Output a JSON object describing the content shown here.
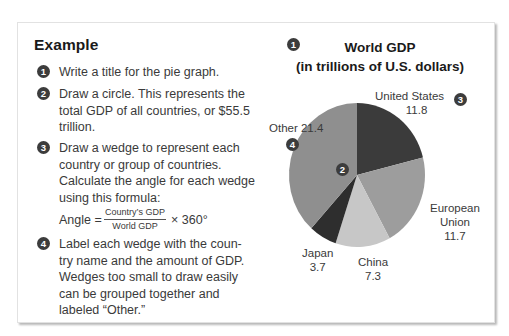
{
  "example": {
    "heading": "Example",
    "steps": [
      {
        "num": "1",
        "lines": [
          "Write a title for the pie graph."
        ]
      },
      {
        "num": "2",
        "lines": [
          "Draw a circle. This represents the",
          "total GDP of all countries, or $55.5",
          "trillion."
        ]
      },
      {
        "num": "3",
        "lines": [
          "Draw a wedge to represent each",
          "country or group of countries.",
          "Calculate the angle for each wedge",
          "using this formula:"
        ]
      },
      {
        "num": "4",
        "lines": [
          "Label each wedge with the coun-",
          "try name and the amount of GDP.",
          "Wedges too small to draw easily",
          "can be grouped together and",
          "labeled “Other.”"
        ]
      }
    ],
    "formula": {
      "lhs": "Angle =",
      "numerator": "Country’s GDP",
      "denominator": "World GDP",
      "rhs": "× 360°"
    }
  },
  "chart_data": {
    "type": "pie",
    "title": "World GDP",
    "subtitle": "(in trillions of U.S. dollars)",
    "categories": [
      "United States",
      "European Union",
      "China",
      "Japan",
      "Other"
    ],
    "values": [
      11.8,
      11.7,
      7.3,
      3.7,
      21.4
    ],
    "colors": [
      "#3b3b3b",
      "#9d9d9d",
      "#c7c7c7",
      "#2e2e2e",
      "#8f8f8f"
    ],
    "start_angle": "12 o'clock, clockwise",
    "labels": [
      {
        "name": "United States",
        "value": "11.8"
      },
      {
        "name": "European Union",
        "name_line1": "European",
        "name_line2": "Union",
        "value": "11.7"
      },
      {
        "name": "China",
        "value": "7.3"
      },
      {
        "name": "Japan",
        "value": "3.7"
      },
      {
        "name": "Other",
        "value": "21.4",
        "combined": "Other 21.4"
      }
    ],
    "step_markers": {
      "title": "1",
      "circle": "2",
      "wedge": "3",
      "label": "4"
    }
  }
}
